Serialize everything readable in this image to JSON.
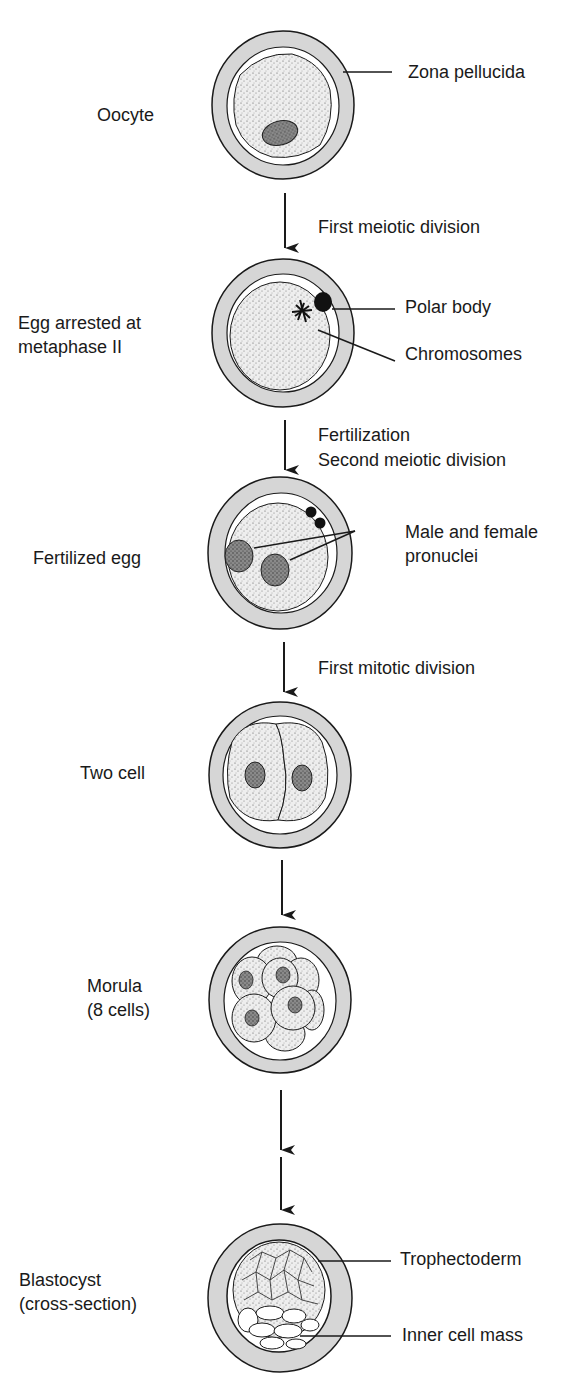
{
  "colors": {
    "zona": "#d6d6d6",
    "ink": "#1a1a1a",
    "cytoplasm": "#e6e6e6",
    "nucleus": "#6a6a6a",
    "background": "#ffffff"
  },
  "stages": [
    {
      "name": "Oocyte",
      "label_lines": [
        "Oocyte"
      ]
    },
    {
      "name": "Egg arrested at metaphase II",
      "label_lines": [
        "Egg arrested at",
        "metaphase II"
      ]
    },
    {
      "name": "Fertilized egg",
      "label_lines": [
        "Fertilized egg"
      ]
    },
    {
      "name": "Two cell",
      "label_lines": [
        "Two cell"
      ]
    },
    {
      "name": "Morula (8 cells)",
      "label_lines": [
        "Morula",
        "(8 cells)"
      ]
    },
    {
      "name": "Blastocyst (cross-section)",
      "label_lines": [
        "Blastocyst",
        "(cross-section)"
      ]
    }
  ],
  "transitions": [
    {
      "from": "Oocyte",
      "to": "Egg arrested at metaphase II",
      "label_lines": [
        "First meiotic division"
      ]
    },
    {
      "from": "Egg arrested at metaphase II",
      "to": "Fertilized egg",
      "label_lines": [
        "Fertilization",
        "Second meiotic division"
      ]
    },
    {
      "from": "Fertilized egg",
      "to": "Two cell",
      "label_lines": [
        "First mitotic division"
      ]
    },
    {
      "from": "Two cell",
      "to": "Morula (8 cells)",
      "label_lines": []
    },
    {
      "from": "Morula (8 cells)",
      "to": "Blastocyst (cross-section)",
      "label_lines": [],
      "broken_arrow": true
    }
  ],
  "annotations": {
    "zona_pellucida": "Zona pellucida",
    "polar_body": "Polar body",
    "chromosomes": "Chromosomes",
    "pronuclei_lines": [
      "Male and female",
      "pronuclei"
    ],
    "trophectoderm": "Trophectoderm",
    "inner_cell_mass": "Inner cell mass"
  }
}
